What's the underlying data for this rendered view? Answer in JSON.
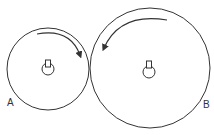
{
  "diagram": {
    "type": "gear-pulley",
    "wheels": [
      {
        "label": "A",
        "rotation": "clockwise"
      },
      {
        "label": "B",
        "rotation": "counterclockwise"
      }
    ],
    "colors": {
      "stroke": "#333333",
      "background": "#ffffff"
    }
  }
}
